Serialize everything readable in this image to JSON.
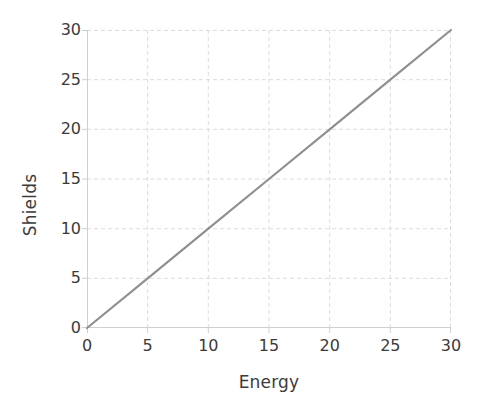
{
  "chart_data": {
    "type": "line",
    "title": "",
    "subtitle": "",
    "xlabel": "Energy",
    "ylabel": "Shields",
    "xlim": [
      0,
      30
    ],
    "ylim": [
      0,
      30
    ],
    "xticks": [
      0,
      5,
      10,
      15,
      20,
      25,
      30
    ],
    "yticks": [
      0,
      5,
      10,
      15,
      20,
      25,
      30
    ],
    "xticklabels": [
      "0",
      "5",
      "10",
      "15",
      "20",
      "25",
      "30"
    ],
    "yticklabels": [
      "0",
      "5",
      "10",
      "15",
      "20",
      "25",
      "30"
    ],
    "grid": true,
    "grid_style": "dashed",
    "grid_color": "#dcdcdc",
    "legend": false,
    "legend_position": "none",
    "annotations": [],
    "series": [
      {
        "name": "Shields vs Energy",
        "color": "#909090",
        "line_width": 2.2,
        "x": [
          0,
          5,
          10,
          15,
          20,
          25,
          30
        ],
        "values": [
          0,
          5,
          10,
          15,
          20,
          25,
          30
        ]
      }
    ],
    "axis_color": "#d0d0d0",
    "text_color": "#3b3b3b",
    "background": "#ffffff"
  }
}
